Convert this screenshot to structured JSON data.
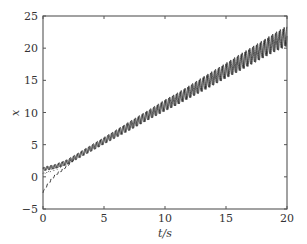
{
  "chart_data": {
    "type": "line",
    "title": "",
    "xlabel": "t/s",
    "ylabel": "x",
    "xlim": [
      0,
      20
    ],
    "ylim": [
      -5,
      25
    ],
    "xticks": [
      0,
      5,
      10,
      15,
      20
    ],
    "yticks": [
      -5,
      0,
      5,
      10,
      15,
      20,
      25
    ],
    "xtick_labels": [
      "0",
      "5",
      "10",
      "15",
      "20"
    ],
    "ytick_labels": [
      "−5",
      "0",
      "5",
      "10",
      "15",
      "20",
      "25"
    ],
    "grid": false,
    "legend": null,
    "series": [
      {
        "name": "solid",
        "style": "solid",
        "color": "#111111",
        "description": "Oscillating trajectory around a linear trend (~1.1 t); band widens over time",
        "x": [
          0,
          1,
          2,
          3,
          4,
          5,
          6,
          7,
          8,
          9,
          10,
          11,
          12,
          13,
          14,
          15,
          16,
          17,
          18,
          19,
          20
        ],
        "y_center": [
          1.2,
          1.6,
          2.3,
          3.4,
          4.5,
          5.6,
          6.7,
          7.8,
          8.9,
          10.0,
          11.1,
          12.1,
          13.2,
          14.3,
          15.4,
          16.5,
          17.6,
          18.7,
          19.8,
          20.9,
          21.9
        ],
        "amplitude": [
          0.3,
          0.35,
          0.4,
          0.45,
          0.5,
          0.55,
          0.6,
          0.7,
          0.75,
          0.8,
          0.9,
          0.95,
          1.0,
          1.1,
          1.15,
          1.2,
          1.3,
          1.35,
          1.4,
          1.5,
          1.6
        ]
      },
      {
        "name": "dashed",
        "style": "dashed",
        "color": "#222222",
        "description": "Transient from negative initial value converging onto the band",
        "x": [
          0,
          0.25,
          0.5,
          0.75,
          1,
          1.25,
          1.5,
          1.75,
          2,
          2.5
        ],
        "y": [
          -2.5,
          -1.6,
          -0.9,
          -0.2,
          0.3,
          0.7,
          1.0,
          1.4,
          1.8,
          2.7
        ]
      },
      {
        "name": "dotted",
        "style": "dotted",
        "color": "#444444",
        "description": "Transient from near-zero initial value converging onto the band",
        "x": [
          0,
          0.5,
          1,
          1.5,
          2,
          2.5
        ],
        "y": [
          0.5,
          0.8,
          1.2,
          1.6,
          2.0,
          2.7
        ]
      }
    ]
  },
  "labels": {
    "x_axis": "t/s",
    "y_axis": "x"
  }
}
